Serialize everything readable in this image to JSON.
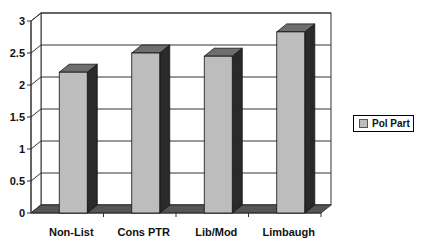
{
  "chart_data": {
    "type": "bar",
    "style": "3d-column",
    "title": "",
    "xlabel": "",
    "ylabel": "",
    "categories": [
      "Non-List",
      "Cons PTR",
      "Lib/Mod",
      "Limbaugh"
    ],
    "series": [
      {
        "name": "Pol Part",
        "values": [
          2.2,
          2.5,
          2.45,
          2.83
        ],
        "color": "#bdbdbd"
      }
    ],
    "ylim": [
      0,
      3
    ],
    "yticks": [
      "0",
      "0.5",
      "1",
      "1.5",
      "2",
      "2.5",
      "3"
    ],
    "grid": true,
    "legend_position": "right"
  },
  "legend": {
    "label": "Pol Part"
  }
}
